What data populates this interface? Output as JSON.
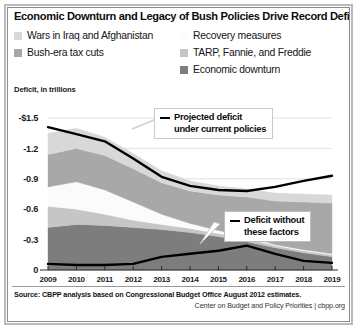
{
  "title": "Economic Downturn and Legacy of Bush Policies Drive Record Deficits",
  "axis_caption": "Deficit, in trillions",
  "legend": {
    "left": [
      {
        "label": "Wars in Iraq and Afghanistan",
        "color": "#d8d8d8",
        "swatch_name": "legend-swatch-wars"
      },
      {
        "label": "Bush-era tax cuts",
        "color": "#a8a8a8",
        "swatch_name": "legend-swatch-tax-cuts"
      }
    ],
    "right": [
      {
        "label": "Recovery measures",
        "color": "#fbfbfb",
        "swatch_name": "legend-swatch-recovery"
      },
      {
        "label": "TARP, Fannie, and Freddie",
        "color": "#c6c6c6",
        "swatch_name": "legend-swatch-tarp"
      },
      {
        "label": "Economic downturn",
        "color": "#7d7d7d",
        "swatch_name": "legend-swatch-downturn"
      }
    ],
    "heading": "Recovery measures"
  },
  "annotations": {
    "projected": {
      "line1": "Projected deficit",
      "line2": "under current policies"
    },
    "without": {
      "line1": "Deficit without",
      "line2": "these factors"
    }
  },
  "footer": {
    "source": "Source: CBPP analysis based on Congressional Budget Office August 2012 estimates.",
    "credit": "Center on Budget and Policy Priorities | cbpp.org"
  },
  "chart_data": {
    "type": "area",
    "title": "Economic Downturn and Legacy of Bush Policies Drive Record Deficits",
    "xlabel": "",
    "ylabel": "Deficit, in trillions",
    "ylim": [
      0,
      -1.5
    ],
    "y_inverted": true,
    "grid": true,
    "legend_position": "top",
    "y_ticks": [
      "-$1.5",
      "-1.2",
      "-0.9",
      "-0.6",
      "-0.3",
      "0"
    ],
    "y_tick_values": [
      -1.5,
      -1.2,
      -0.9,
      -0.6,
      -0.3,
      0
    ],
    "categories": [
      2009,
      2010,
      2011,
      2012,
      2013,
      2014,
      2015,
      2016,
      2017,
      2018,
      2019
    ],
    "x_tick_labels": [
      "2009",
      "2010",
      "2011",
      "2012",
      "2013",
      "2014",
      "2015",
      "2016",
      "2017",
      "2018",
      "2019"
    ],
    "stack_order_bottom_to_top": [
      "Economic downturn",
      "TARP, Fannie, and Freddie",
      "Recovery measures",
      "Bush-era tax cuts",
      "Wars in Iraq and Afghanistan"
    ],
    "series": [
      {
        "name": "Economic downturn",
        "color": "#7d7d7d",
        "values": [
          0.42,
          0.45,
          0.44,
          0.42,
          0.4,
          0.37,
          0.33,
          0.28,
          0.22,
          0.17,
          0.13
        ]
      },
      {
        "name": "TARP, Fannie, and Freddie",
        "color": "#c6c6c6",
        "values": [
          0.21,
          0.15,
          0.11,
          0.07,
          0.05,
          0.04,
          0.03,
          0.03,
          0.02,
          0.02,
          0.02
        ]
      },
      {
        "name": "Recovery measures",
        "color": "#fbfbfb",
        "values": [
          0.19,
          0.27,
          0.24,
          0.18,
          0.1,
          0.05,
          0.03,
          0.02,
          0.01,
          0.01,
          0.01
        ]
      },
      {
        "name": "Bush-era tax cuts",
        "color": "#a8a8a8",
        "values": [
          0.32,
          0.33,
          0.34,
          0.33,
          0.31,
          0.32,
          0.35,
          0.39,
          0.43,
          0.47,
          0.5
        ]
      },
      {
        "name": "Wars in Iraq and Afghanistan",
        "color": "#d8d8d8",
        "values": [
          0.21,
          0.2,
          0.18,
          0.15,
          0.12,
          0.1,
          0.09,
          0.08,
          0.08,
          0.08,
          0.08
        ]
      }
    ],
    "lines": [
      {
        "name": "Projected deficit under current policies",
        "color": "#000000",
        "values": [
          -1.41,
          -1.34,
          -1.27,
          -1.1,
          -0.92,
          -0.83,
          -0.79,
          -0.78,
          -0.82,
          -0.88,
          -0.93
        ]
      },
      {
        "name": "Deficit without these factors",
        "color": "#000000",
        "values": [
          -0.06,
          -0.05,
          -0.05,
          -0.06,
          -0.13,
          -0.16,
          -0.19,
          -0.24,
          -0.16,
          -0.09,
          -0.07
        ]
      }
    ]
  }
}
